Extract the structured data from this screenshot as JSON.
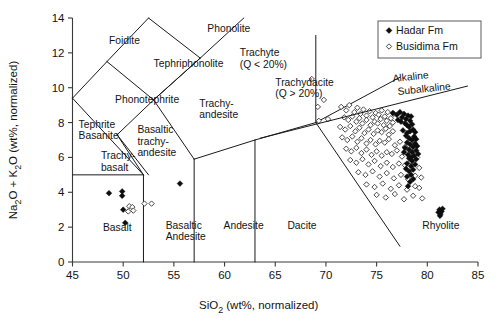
{
  "chart_data": {
    "type": "scatter",
    "title": "",
    "xlabel": "SiO2 (wt%, normalized)",
    "ylabel": "Na2O + K2O (wt%, normalized)",
    "xlim": [
      45,
      85
    ],
    "ylim": [
      0,
      14
    ],
    "xticks": [
      45,
      50,
      55,
      60,
      65,
      70,
      75,
      80,
      85
    ],
    "yticks": [
      0,
      2,
      4,
      6,
      8,
      10,
      12,
      14
    ],
    "grid": false,
    "legend_position": "top-right",
    "series": [
      {
        "name": "Hadar Fm",
        "marker": "filled-diamond",
        "color": "#0d0d0d",
        "points": [
          [
            48.6,
            3.95
          ],
          [
            49.9,
            4.05
          ],
          [
            49.9,
            3.8
          ],
          [
            50.0,
            3.0
          ],
          [
            50.2,
            2.25
          ],
          [
            55.6,
            4.5
          ],
          [
            76.6,
            8.55
          ],
          [
            77.0,
            8.45
          ],
          [
            77.3,
            8.6
          ],
          [
            77.5,
            8.3
          ],
          [
            77.7,
            8.5
          ],
          [
            77.9,
            8.2
          ],
          [
            78.1,
            8.4
          ],
          [
            78.3,
            8.1
          ],
          [
            78.4,
            8.35
          ],
          [
            77.1,
            8.15
          ],
          [
            77.4,
            8.05
          ],
          [
            77.8,
            7.95
          ],
          [
            78.0,
            7.85
          ],
          [
            78.2,
            7.75
          ],
          [
            78.5,
            7.9
          ],
          [
            78.6,
            7.6
          ],
          [
            78.8,
            7.45
          ],
          [
            78.3,
            7.5
          ],
          [
            78.0,
            7.4
          ],
          [
            77.6,
            7.55
          ],
          [
            78.7,
            7.2
          ],
          [
            78.9,
            7.05
          ],
          [
            78.5,
            7.0
          ],
          [
            78.2,
            7.1
          ],
          [
            77.9,
            7.25
          ],
          [
            78.8,
            6.8
          ],
          [
            79.0,
            6.65
          ],
          [
            78.6,
            6.6
          ],
          [
            78.3,
            6.75
          ],
          [
            78.0,
            6.85
          ],
          [
            78.9,
            6.4
          ],
          [
            78.5,
            6.3
          ],
          [
            78.2,
            6.45
          ],
          [
            77.8,
            6.55
          ],
          [
            79.1,
            6.2
          ],
          [
            78.7,
            6.1
          ],
          [
            78.4,
            6.0
          ],
          [
            78.1,
            6.15
          ],
          [
            77.7,
            6.3
          ],
          [
            78.9,
            5.9
          ],
          [
            78.5,
            5.8
          ],
          [
            78.2,
            5.95
          ],
          [
            78.8,
            5.6
          ],
          [
            78.4,
            5.5
          ],
          [
            78.0,
            5.65
          ],
          [
            78.6,
            5.3
          ],
          [
            78.2,
            5.2
          ],
          [
            77.9,
            5.35
          ],
          [
            78.4,
            5.0
          ],
          [
            78.0,
            4.9
          ],
          [
            78.3,
            4.6
          ],
          [
            78.6,
            4.75
          ],
          [
            78.1,
            4.35
          ],
          [
            81.2,
            3.0
          ],
          [
            81.4,
            2.9
          ],
          [
            81.3,
            2.75
          ],
          [
            81.1,
            2.85
          ],
          [
            81.5,
            3.05
          ],
          [
            81.25,
            2.65
          ]
        ]
      },
      {
        "name": "Busidima Fm",
        "marker": "open-diamond",
        "color": "#2b2b2b",
        "points": [
          [
            50.6,
            3.2
          ],
          [
            50.9,
            3.15
          ],
          [
            50.5,
            2.9
          ],
          [
            51.0,
            2.95
          ],
          [
            52.1,
            3.35
          ],
          [
            52.8,
            3.35
          ],
          [
            68.6,
            10.5
          ],
          [
            69.2,
            8.9
          ],
          [
            69.3,
            8.1
          ],
          [
            71.5,
            8.9
          ],
          [
            72.0,
            8.7
          ],
          [
            72.3,
            9.0
          ],
          [
            72.8,
            8.6
          ],
          [
            73.1,
            8.85
          ],
          [
            73.4,
            8.5
          ],
          [
            73.7,
            8.75
          ],
          [
            74.0,
            8.4
          ],
          [
            74.3,
            8.65
          ],
          [
            74.6,
            8.3
          ],
          [
            74.9,
            8.55
          ],
          [
            75.2,
            8.45
          ],
          [
            75.5,
            8.7
          ],
          [
            75.8,
            8.35
          ],
          [
            76.1,
            8.6
          ],
          [
            76.4,
            8.25
          ],
          [
            76.7,
            8.5
          ],
          [
            71.8,
            8.3
          ],
          [
            72.2,
            8.15
          ],
          [
            72.6,
            8.35
          ],
          [
            73.0,
            8.05
          ],
          [
            73.3,
            8.25
          ],
          [
            73.6,
            7.95
          ],
          [
            74.0,
            8.15
          ],
          [
            74.4,
            7.85
          ],
          [
            74.8,
            8.05
          ],
          [
            75.1,
            7.95
          ],
          [
            75.4,
            8.2
          ],
          [
            75.7,
            7.85
          ],
          [
            76.0,
            8.1
          ],
          [
            76.3,
            7.8
          ],
          [
            76.6,
            8.0
          ],
          [
            71.4,
            7.75
          ],
          [
            71.9,
            7.6
          ],
          [
            72.4,
            7.8
          ],
          [
            72.9,
            7.5
          ],
          [
            73.3,
            7.7
          ],
          [
            73.8,
            7.4
          ],
          [
            74.2,
            7.6
          ],
          [
            74.7,
            7.35
          ],
          [
            75.1,
            7.55
          ],
          [
            75.5,
            7.45
          ],
          [
            75.9,
            7.65
          ],
          [
            76.2,
            7.3
          ],
          [
            76.6,
            7.5
          ],
          [
            71.6,
            7.15
          ],
          [
            72.1,
            7.0
          ],
          [
            72.6,
            7.2
          ],
          [
            73.1,
            6.9
          ],
          [
            73.5,
            7.1
          ],
          [
            74.0,
            6.8
          ],
          [
            74.4,
            7.0
          ],
          [
            74.9,
            6.75
          ],
          [
            75.3,
            6.95
          ],
          [
            75.8,
            6.85
          ],
          [
            76.2,
            7.05
          ],
          [
            76.8,
            6.7
          ],
          [
            77.3,
            6.9
          ],
          [
            77.8,
            6.6
          ],
          [
            72.0,
            6.5
          ],
          [
            72.5,
            6.35
          ],
          [
            73.0,
            6.55
          ],
          [
            73.5,
            6.25
          ],
          [
            74.0,
            6.45
          ],
          [
            74.5,
            6.15
          ],
          [
            75.0,
            6.35
          ],
          [
            75.5,
            6.1
          ],
          [
            76.0,
            6.3
          ],
          [
            76.5,
            6.2
          ],
          [
            77.0,
            6.4
          ],
          [
            77.5,
            6.05
          ],
          [
            78.0,
            6.25
          ],
          [
            79.0,
            6.0
          ],
          [
            72.4,
            5.85
          ],
          [
            73.0,
            5.7
          ],
          [
            73.6,
            5.9
          ],
          [
            74.2,
            5.6
          ],
          [
            74.8,
            5.8
          ],
          [
            75.4,
            5.5
          ],
          [
            76.0,
            5.7
          ],
          [
            76.6,
            5.45
          ],
          [
            77.2,
            5.65
          ],
          [
            77.8,
            5.55
          ],
          [
            78.4,
            5.75
          ],
          [
            79.2,
            5.4
          ],
          [
            73.2,
            5.15
          ],
          [
            73.9,
            5.0
          ],
          [
            74.6,
            5.2
          ],
          [
            75.3,
            4.9
          ],
          [
            76.0,
            5.1
          ],
          [
            76.7,
            4.8
          ],
          [
            77.4,
            5.0
          ],
          [
            78.1,
            4.75
          ],
          [
            78.8,
            4.95
          ],
          [
            79.4,
            4.85
          ],
          [
            74.0,
            4.45
          ],
          [
            74.8,
            4.3
          ],
          [
            75.6,
            4.5
          ],
          [
            76.4,
            4.2
          ],
          [
            77.2,
            4.4
          ],
          [
            78.0,
            4.15
          ],
          [
            78.8,
            4.35
          ],
          [
            79.2,
            4.25
          ],
          [
            75.0,
            3.85
          ],
          [
            75.9,
            3.7
          ],
          [
            76.8,
            3.9
          ],
          [
            77.7,
            3.6
          ],
          [
            78.6,
            3.8
          ],
          [
            79.5,
            3.65
          ],
          [
            69.8,
            9.3
          ],
          [
            70.2,
            8.2
          ]
        ]
      }
    ],
    "fields": [
      {
        "name": "Foidite",
        "label_x": 48.6,
        "label_y": 12.5
      },
      {
        "name": "Phonolite",
        "label_x": 58.3,
        "label_y": 13.2
      },
      {
        "name": "Tephriphonolite",
        "label_x": 53.0,
        "label_y": 11.2
      },
      {
        "name": "Phonotephrite",
        "label_x": 49.2,
        "label_y": 9.1
      },
      {
        "name": "Tephrite\nBasanite",
        "label_x": 45.6,
        "label_y": 7.7
      },
      {
        "name": "Trachy-\nbasalt",
        "label_x": 47.8,
        "label_y": 5.9
      },
      {
        "name": "Basaltic\ntrachy-\nandesite",
        "label_x": 51.4,
        "label_y": 7.4
      },
      {
        "name": "Trachy-\nandesite",
        "label_x": 57.5,
        "label_y": 8.9
      },
      {
        "name": "Trachyte\n(Q < 20%)",
        "label_x": 61.5,
        "label_y": 11.8
      },
      {
        "name": "Trachydacite\n(Q > 20%)",
        "label_x": 65.0,
        "label_y": 10.1
      },
      {
        "name": "Basalt",
        "label_x": 48.0,
        "label_y": 1.8
      },
      {
        "name": "Basaltic\nAndesite",
        "label_x": 54.2,
        "label_y": 1.9
      },
      {
        "name": "Andesite",
        "label_x": 59.9,
        "label_y": 1.9
      },
      {
        "name": "Dacite",
        "label_x": 66.2,
        "label_y": 1.9
      },
      {
        "name": "Rhyolite",
        "label_x": 79.5,
        "label_y": 1.9
      }
    ],
    "annotations": [
      {
        "text": "Alkaline",
        "x": 76.2,
        "y": 10.0
      },
      {
        "text": "Subalkaline",
        "x": 77.0,
        "y": 9.2
      }
    ]
  },
  "axes": {
    "x_title": "SiO2 (wt%, normalized)",
    "x_title_main": "SiO",
    "x_title_sub": "2",
    "x_title_rest": " (wt%, normalized)",
    "y_title_a": "Na",
    "y_title_a_sub": "2",
    "y_title_b": "O + K",
    "y_title_b_sub": "2",
    "y_title_c": "O (wt%, normalized)",
    "xticks": [
      "45",
      "50",
      "55",
      "60",
      "65",
      "70",
      "75",
      "80",
      "85"
    ],
    "yticks": [
      "0",
      "2",
      "4",
      "6",
      "8",
      "10",
      "12",
      "14"
    ]
  },
  "field_labels": {
    "foidite": "Foidite",
    "phonolite": "Phonolite",
    "tephriphonolite": "Tephriphonolite",
    "phonotephrite": "Phonotephrite",
    "tephrite": "Tephrite",
    "basanite": "Basanite",
    "trachy": "Trachy-",
    "basalt_hy": "basalt",
    "basaltic": "Basaltic",
    "trachy2": "trachy-",
    "andesite_hy": "andesite",
    "trachy3": "Trachy-",
    "andesite_hy2": "andesite",
    "trachyte": "Trachyte",
    "trachyte_q": "(Q < 20%)",
    "trachydacite": "Trachydacite",
    "trachydacite_q": "(Q > 20%)",
    "basalt": "Basalt",
    "basaltic2": "Basaltic",
    "andesite2": "Andesite",
    "andesite": "Andesite",
    "dacite": "Dacite",
    "rhyolite": "Rhyolite",
    "alkaline": "Alkaline",
    "subalkaline": "Subalkaline"
  },
  "legend": {
    "items": [
      {
        "label": "Hadar Fm",
        "marker": "filled-diamond"
      },
      {
        "label": "Busidima Fm",
        "marker": "open-diamond"
      }
    ]
  }
}
